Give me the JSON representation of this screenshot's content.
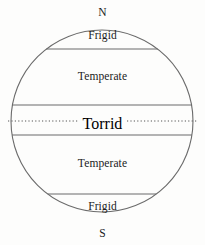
{
  "figure": {
    "background_color": "#fdfdfc",
    "line_color": "#6b6b6b",
    "text_color": "#1b1b1b"
  },
  "globe": {
    "center_x": 102,
    "center_y": 121,
    "radius": 91,
    "outline_color": "#6b6b6b"
  },
  "poles": {
    "north_label": "N",
    "south_label": "S"
  },
  "equator": {
    "label": "Torrid",
    "style": "dotted",
    "y": 121,
    "x_start": 8,
    "x_end": 197
  },
  "boundaries": [
    {
      "name": "arctic-circle",
      "y": 49,
      "style": "solid"
    },
    {
      "name": "tropic-of-cancer",
      "y": 105,
      "style": "solid"
    },
    {
      "name": "tropic-of-capricorn",
      "y": 135,
      "style": "solid"
    },
    {
      "name": "antarctic-circle",
      "y": 194,
      "style": "solid"
    }
  ],
  "zones": [
    {
      "name": "north-frigid",
      "label": "Frigid",
      "label_y": 30
    },
    {
      "name": "north-temperate",
      "label": "Temperate",
      "label_y": 71
    },
    {
      "name": "torrid",
      "label": "Torrid",
      "label_y": 115
    },
    {
      "name": "south-temperate",
      "label": "Temperate",
      "label_y": 158
    },
    {
      "name": "south-frigid",
      "label": "Frigid",
      "label_y": 201
    }
  ]
}
